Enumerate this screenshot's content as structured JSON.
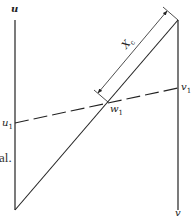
{
  "diagram": {
    "labels": {
      "u": "u",
      "v": "v",
      "u1_base": "u",
      "u1_sub": "1",
      "v1_base": "v",
      "v1_sub": "1",
      "w1_base": "w",
      "w1_sub": "1",
      "dimension_base": "X",
      "dimension_sub": "c"
    },
    "edge_text": "al.",
    "colors": {
      "line": "#222222",
      "background": "#ffffff"
    },
    "geometry": {
      "u_axis": {
        "x": 15,
        "y_top": 20,
        "y_bottom": 210
      },
      "v_axis": {
        "x": 178,
        "y_top": 20,
        "y_bottom": 210
      },
      "diagonal": {
        "from": [
          15,
          210
        ],
        "to": [
          178,
          20
        ]
      },
      "dashed_line": {
        "from": [
          15,
          123
        ],
        "to": [
          178,
          88
        ]
      },
      "w1_point": [
        108,
        102
      ]
    }
  }
}
